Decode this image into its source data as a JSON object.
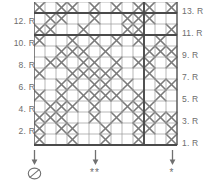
{
  "chart_data": {
    "type": "table",
    "grid": {
      "columns": 13,
      "rows": 13,
      "cell_symbol": "cable-cross-x",
      "cell_width_px": 11,
      "cell_height_px": 11
    },
    "row_labels_left": [
      "12. R",
      "10. R",
      "8. R",
      "6. R",
      "4. R",
      "2. R"
    ],
    "row_labels_right": [
      "13. R",
      "11. R",
      "9. R",
      "7. R",
      "5. R",
      "3. R",
      "1. R"
    ],
    "heavy_lines": {
      "horizontal_rows": [
        11,
        1,
        13
      ],
      "vertical_columns": [
        10
      ]
    },
    "cells": [
      [
        1,
        0,
        1,
        1,
        0,
        1,
        0,
        1,
        0,
        1,
        1,
        0,
        1
      ],
      [
        0,
        1,
        1,
        0,
        0,
        1,
        0,
        0,
        1,
        1,
        1,
        0,
        0
      ],
      [
        1,
        1,
        0,
        0,
        1,
        0,
        0,
        0,
        1,
        1,
        0,
        0,
        1
      ],
      [
        1,
        0,
        0,
        1,
        0,
        1,
        0,
        1,
        0,
        1,
        0,
        1,
        0
      ],
      [
        0,
        0,
        1,
        1,
        1,
        0,
        1,
        0,
        0,
        0,
        1,
        1,
        1
      ],
      [
        0,
        1,
        1,
        0,
        1,
        1,
        0,
        1,
        0,
        1,
        1,
        0,
        1
      ],
      [
        1,
        0,
        0,
        1,
        1,
        1,
        1,
        1,
        0,
        0,
        1,
        0,
        0
      ],
      [
        0,
        0,
        1,
        1,
        0,
        1,
        1,
        0,
        1,
        0,
        0,
        1,
        1
      ],
      [
        1,
        0,
        1,
        0,
        1,
        1,
        1,
        1,
        0,
        1,
        0,
        1,
        0
      ],
      [
        0,
        1,
        1,
        1,
        0,
        1,
        0,
        0,
        1,
        1,
        1,
        0,
        0
      ],
      [
        1,
        1,
        1,
        0,
        0,
        1,
        0,
        1,
        0,
        1,
        1,
        1,
        1
      ],
      [
        1,
        0,
        1,
        1,
        0,
        0,
        1,
        0,
        0,
        1,
        1,
        0,
        1
      ],
      [
        1,
        0,
        0,
        1,
        0,
        0,
        1,
        0,
        0,
        1,
        0,
        0,
        1
      ]
    ]
  },
  "legend": {
    "items": [
      {
        "name": "symbol-circle-slash",
        "symbol": "circle-slash",
        "label": "",
        "x": 34
      },
      {
        "name": "symbol-double-star",
        "symbol": "**",
        "label": "**",
        "x": 95
      },
      {
        "name": "symbol-single-star",
        "symbol": "*",
        "label": "*",
        "x": 172
      }
    ]
  },
  "colors": {
    "grid_line": "#9a9a9a",
    "heavy_line": "#4a4a4a",
    "symbol": "#7a7a7a",
    "text": "#6d6d6d",
    "background": "#ffffff"
  }
}
